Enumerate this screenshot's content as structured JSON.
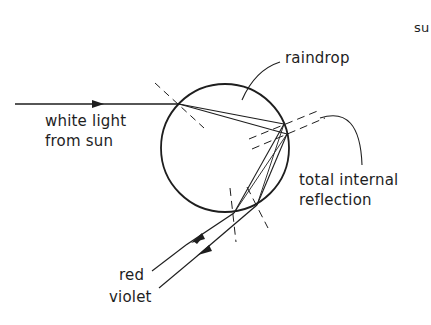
{
  "labels": {
    "raindrop": "raindrop",
    "white_light_line1": "white light",
    "white_light_line2": "from sun",
    "tir_line1": "total internal",
    "tir_line2": "reflection",
    "red": "red",
    "violet": "violet",
    "corner_fragment": "su"
  },
  "colors": {
    "ink": "#1e1e1e",
    "background": "#ffffff"
  },
  "geometry": {
    "raindrop_center": [
      225,
      148
    ],
    "raindrop_radius": 64
  }
}
